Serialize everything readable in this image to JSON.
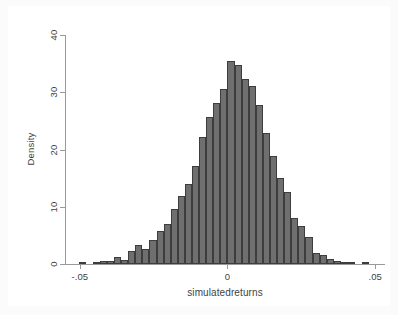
{
  "chart_data": {
    "type": "bar",
    "subtype": "histogram",
    "title": "",
    "subtitle": "",
    "xlabel": "simulatedreturns",
    "ylabel": "Density",
    "xlim": [
      -0.055,
      0.053
    ],
    "ylim": [
      0,
      40
    ],
    "xticks": [
      -0.05,
      0,
      0.05
    ],
    "xticklabels": [
      "-.05",
      "0",
      ".05"
    ],
    "yticks": [
      0,
      10,
      20,
      30,
      40
    ],
    "yticklabels": [
      "0",
      "10",
      "20",
      "30",
      "40"
    ],
    "grid": true,
    "grid_axis": "y",
    "legend": null,
    "legend_position": "none",
    "bin_width": 0.0024,
    "bar_color": "#6f6f6f",
    "bar_edge_color": "#3d3d3d",
    "background_color": "#ffffff",
    "figure_background_color": "#fbfbfb",
    "axis_color": "#9a9a9a",
    "text_color": "#3f3f3f",
    "n_bins": 40,
    "x": [
      -0.0492,
      -0.0468,
      -0.0444,
      -0.042,
      -0.0396,
      -0.0372,
      -0.0348,
      -0.0324,
      -0.03,
      -0.0276,
      -0.0252,
      -0.0228,
      -0.0204,
      -0.018,
      -0.0156,
      -0.0132,
      -0.0108,
      -0.0084,
      -0.006,
      -0.0036,
      -0.0012,
      0.0012,
      0.0036,
      0.006,
      0.0084,
      0.0108,
      0.0132,
      0.0156,
      0.018,
      0.0204,
      0.0228,
      0.0252,
      0.0276,
      0.03,
      0.0324,
      0.0348,
      0.0372,
      0.0396,
      0.042,
      0.0468
    ],
    "values": [
      0.2,
      0.0,
      0.3,
      0.5,
      0.6,
      1.3,
      0.7,
      2.2,
      3.4,
      2.6,
      4.2,
      5.8,
      7.0,
      9.6,
      11.9,
      14.0,
      17.1,
      22.1,
      25.7,
      28.2,
      30.5,
      35.4,
      34.7,
      32.4,
      31.1,
      27.7,
      22.8,
      18.9,
      15.1,
      12.6,
      8.1,
      6.7,
      4.8,
      1.9,
      1.6,
      0.9,
      0.5,
      0.3,
      0.2,
      0.2
    ]
  },
  "axes": {
    "y_title": "Density",
    "x_title": "simulatedreturns"
  }
}
